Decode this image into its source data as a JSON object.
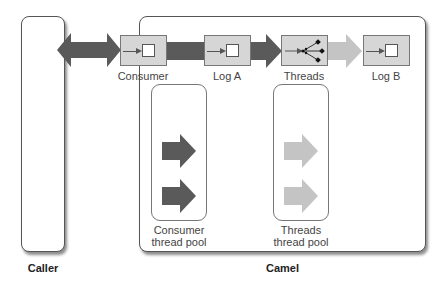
{
  "diagram": {
    "caller": {
      "label": "Caller"
    },
    "camel": {
      "label": "Camel"
    },
    "route": {
      "nodes": [
        {
          "id": "consumer",
          "label": "Consumer",
          "icon": "endpoint-icon"
        },
        {
          "id": "log-a",
          "label": "Log A",
          "icon": "processor-icon"
        },
        {
          "id": "threads",
          "label": "Threads",
          "icon": "fork-threads-icon"
        },
        {
          "id": "log-b",
          "label": "Log B",
          "icon": "processor-icon"
        }
      ]
    },
    "pools": [
      {
        "id": "consumer-pool",
        "label_line1": "Consumer",
        "label_line2": "thread pool",
        "arrow_color": "#5a5a5a"
      },
      {
        "id": "threads-pool",
        "label_line1": "Threads",
        "label_line2": "thread pool",
        "arrow_color": "#c4c4c4"
      }
    ],
    "colors": {
      "dark_arrow": "#5a5a5a",
      "light_arrow": "#c4c4c4",
      "node_fill": "#d6d6d6"
    }
  }
}
